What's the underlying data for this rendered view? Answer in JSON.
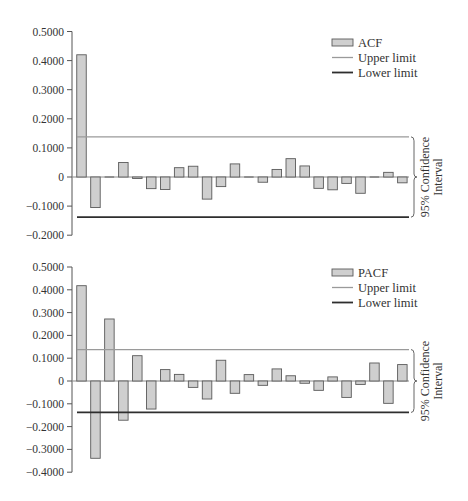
{
  "chart_data": [
    {
      "type": "bar",
      "name": "acf",
      "title": "",
      "xlabel": "",
      "ylabel": "",
      "legend": [
        "ACF",
        "Upper limit",
        "Lower limit"
      ],
      "legend_position": "top-right",
      "grid": false,
      "ylim": [
        -0.2,
        0.5
      ],
      "yticks": [
        0.5,
        0.4,
        0.3,
        0.2,
        0.1,
        0,
        -0.1,
        -0.2
      ],
      "ytick_labels": [
        "0.5000",
        "0.4000",
        "0.3000",
        "0.2000",
        "0.1000",
        "0",
        "−0.1000",
        "−0.2000"
      ],
      "categories": [
        1,
        2,
        3,
        4,
        5,
        6,
        7,
        8,
        9,
        10,
        11,
        12,
        13,
        14,
        15,
        16,
        17,
        18,
        19,
        20,
        21,
        22,
        23,
        24
      ],
      "values": [
        0.42,
        -0.105,
        0.0,
        0.05,
        -0.005,
        -0.04,
        -0.043,
        0.032,
        0.037,
        -0.076,
        -0.033,
        0.045,
        0.002,
        -0.018,
        0.026,
        0.063,
        0.038,
        -0.039,
        -0.044,
        -0.022,
        -0.056,
        0.002,
        0.016,
        -0.02
      ],
      "upper_limit": 0.138,
      "lower_limit": -0.138,
      "annotation": "95% Confidence Interval",
      "annotation_lines": [
        "95% Confidence",
        "Interval"
      ]
    },
    {
      "type": "bar",
      "name": "pacf",
      "title": "",
      "xlabel": "",
      "ylabel": "",
      "legend": [
        "PACF",
        "Upper limit",
        "Lower limit"
      ],
      "legend_position": "top-right",
      "grid": false,
      "ylim": [
        -0.4,
        0.5
      ],
      "yticks": [
        0.5,
        0.4,
        0.3,
        0.2,
        0.1,
        0,
        -0.1,
        -0.2,
        -0.3,
        -0.4
      ],
      "ytick_labels": [
        "0.5000",
        "0.4000",
        "0.3000",
        "0.2000",
        "0.1000",
        "0",
        "−0.1000",
        "−0.2000",
        "−0.3000",
        "−0.4000"
      ],
      "categories": [
        1,
        2,
        3,
        4,
        5,
        6,
        7,
        8,
        9,
        10,
        11,
        12,
        13,
        14,
        15,
        16,
        17,
        18,
        19,
        20,
        21,
        22,
        23,
        24
      ],
      "values": [
        0.418,
        -0.339,
        0.272,
        -0.172,
        0.111,
        -0.123,
        0.05,
        0.029,
        -0.028,
        -0.079,
        0.091,
        -0.054,
        0.028,
        -0.019,
        0.053,
        0.023,
        -0.01,
        -0.041,
        0.018,
        -0.072,
        -0.015,
        0.079,
        -0.098,
        0.072
      ],
      "upper_limit": 0.138,
      "lower_limit": -0.138,
      "annotation": "95% Confidence Interval",
      "annotation_lines": [
        "95% Confidence",
        "Interval"
      ]
    }
  ],
  "colors": {
    "bar_fill": "#cfcfcf",
    "bar_stroke": "#5a5a5a",
    "upper_limit": "#9a9a9a",
    "lower_limit": "#2e2e2e",
    "axis": "#555555",
    "text": "#333333"
  },
  "layout": [
    {
      "axis_x": 72,
      "zero_y": 177,
      "px_per_unit": 291,
      "first_bar_center": 81.5,
      "bar_step": 13.95,
      "bar_width": 9.5,
      "line_x1": 77,
      "line_x2": 409,
      "legend_x": 332,
      "legend_y": 43,
      "brace_x": 411
    },
    {
      "axis_x": 72,
      "zero_y": 381,
      "px_per_unit": 228,
      "first_bar_center": 81.5,
      "bar_step": 13.95,
      "bar_width": 9.5,
      "line_x1": 77,
      "line_x2": 409,
      "legend_x": 332,
      "legend_y": 273,
      "brace_x": 411
    }
  ]
}
